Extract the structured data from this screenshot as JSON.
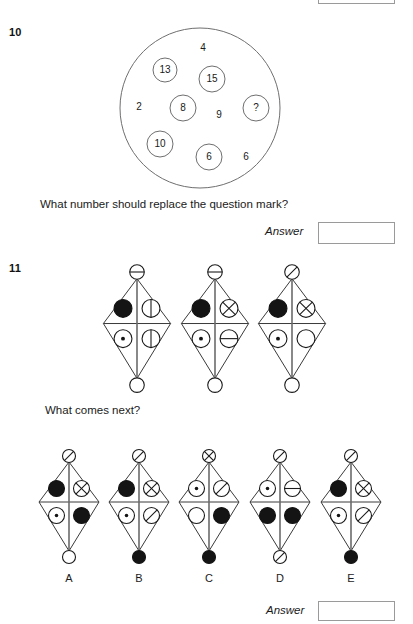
{
  "page": {
    "top_partial_answer_box": true
  },
  "q10": {
    "number": "10",
    "prompt": "What number should replace the question mark?",
    "answer_label": "Answer",
    "answer_value": "",
    "circled_numbers": [
      {
        "label": "13",
        "cx": 165,
        "cy": 70,
        "r": 12
      },
      {
        "label": "15",
        "cx": 212,
        "cy": 79,
        "r": 13
      },
      {
        "label": "8",
        "cx": 183,
        "cy": 108,
        "r": 13
      },
      {
        "label": "?",
        "cx": 256,
        "cy": 108,
        "r": 13
      },
      {
        "label": "10",
        "cx": 160,
        "cy": 144,
        "r": 13
      },
      {
        "label": "6",
        "cx": 209,
        "cy": 157,
        "r": 13
      }
    ],
    "loose_numbers": [
      {
        "label": "4",
        "x": 203,
        "y": 48
      },
      {
        "label": "2",
        "x": 139,
        "y": 107
      },
      {
        "label": "9",
        "x": 219,
        "y": 115
      },
      {
        "label": "6",
        "x": 246,
        "y": 157
      }
    ],
    "outer_circle": {
      "cx": 200,
      "cy": 108,
      "r": 80
    }
  },
  "q11": {
    "number": "11",
    "prompt": "What comes next?",
    "answer_label": "Answer",
    "answer_value": "",
    "node_types": {
      "open": "empty-circle",
      "filled": "filled-circle",
      "dot": "dotted-circle",
      "hline": "horizontal-line-circle",
      "vline": "vertical-line-circle",
      "diag": "diagonal-line-circle",
      "cross": "crossed-circle"
    },
    "sequence": [
      {
        "id": "seq-1",
        "top": "hline",
        "left": "filled",
        "right": "vline",
        "lower_left": "dot",
        "lower_right": "vline",
        "bottom": "open"
      },
      {
        "id": "seq-2",
        "top": "hline",
        "left": "filled",
        "right": "cross",
        "lower_left": "dot",
        "lower_right": "hline",
        "bottom": "open"
      },
      {
        "id": "seq-3",
        "top": "diag",
        "left": "filled",
        "right": "cross",
        "lower_left": "dot",
        "lower_right": "open",
        "bottom": "open"
      }
    ],
    "options": [
      {
        "label": "A",
        "top": "diag",
        "left": "filled",
        "right": "cross",
        "lower_left": "dot",
        "lower_right": "filled",
        "bottom": "open"
      },
      {
        "label": "B",
        "top": "diag",
        "left": "filled",
        "right": "cross",
        "lower_left": "dot",
        "lower_right": "diag",
        "bottom": "filled"
      },
      {
        "label": "C",
        "top": "cross",
        "left": "dot",
        "right": "diag",
        "lower_left": "open",
        "lower_right": "filled",
        "bottom": "filled"
      },
      {
        "label": "D",
        "top": "diag",
        "left": "dot",
        "right": "hline",
        "lower_left": "filled",
        "lower_right": "filled",
        "bottom": "diag"
      },
      {
        "label": "E",
        "top": "diag",
        "left": "filled",
        "right": "cross",
        "lower_left": "dot",
        "lower_right": "diag",
        "bottom": "filled"
      }
    ]
  }
}
